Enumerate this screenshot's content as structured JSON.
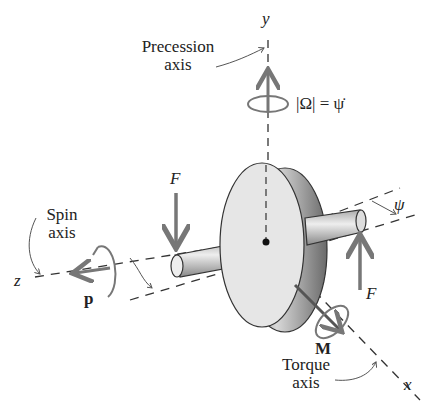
{
  "diagram": {
    "axes": {
      "y": {
        "symbol": "y",
        "caption_line1": "Precession",
        "caption_line2": "axis"
      },
      "z": {
        "symbol": "z",
        "caption_line1": "Spin",
        "caption_line2": "axis"
      },
      "x": {
        "symbol": "x",
        "caption_line1": "Torque",
        "caption_line2": "axis"
      }
    },
    "labels": {
      "precession_rate": "|Ω| = ψ̇",
      "force_left": "F",
      "force_right": "F",
      "angular_momentum": "p",
      "moment": "M",
      "angle": "ψ"
    },
    "colors": {
      "line": "#333333",
      "arrow": "#777777",
      "disk_face": "#e6e6e6",
      "disk_rim": "#9a9a9a"
    }
  }
}
